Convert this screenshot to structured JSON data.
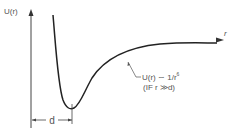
{
  "diagram": {
    "y_axis_label": "U(r)",
    "x_axis_label": "r",
    "distance_marker_label": "d",
    "annotation": {
      "line1": "U(r) ∼ 1/r",
      "line1_superscript": "6",
      "line2": "(IF r ≫d)"
    },
    "colors": {
      "curve": "#222222",
      "axis_left": "#4a4adf",
      "axis_right": "#e05060",
      "axis_arrow": "#333333",
      "text": "#555555"
    }
  }
}
